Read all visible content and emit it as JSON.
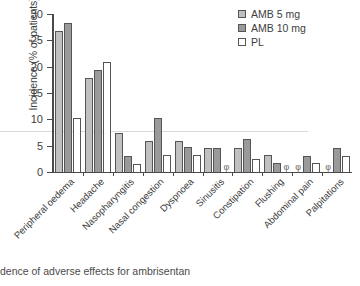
{
  "chart_data": {
    "type": "bar",
    "title": "",
    "xlabel": "",
    "ylabel": "Incidence (% of patients)",
    "ylim": [
      0,
      30
    ],
    "yticks": [
      0,
      5,
      10,
      15,
      20,
      25,
      30
    ],
    "grid": false,
    "legend_position": "top-right",
    "zero_marker": "φ",
    "zero_marker_note": "phi symbol denotes zero incidence",
    "categories": [
      "Peripheral oedema",
      "Headache",
      "Nasopharyngitis",
      "Nasal congestion",
      "Dyspnoea",
      "Sinusitis",
      "Constipation",
      "Flushing",
      "Abdominal pain",
      "Palpitations"
    ],
    "series": [
      {
        "name": "AMB 5 mg",
        "color": "#c0c0c0",
        "values": [
          26.8,
          17.8,
          7.5,
          5.8,
          5.8,
          4.5,
          4.5,
          3.2,
          0,
          0
        ]
      },
      {
        "name": "AMB 10 mg",
        "color": "#9a9a9a",
        "values": [
          28.3,
          19.3,
          3.1,
          10.3,
          4.8,
          4.5,
          6.3,
          1.8,
          3.1,
          4.5
        ]
      },
      {
        "name": "PL",
        "color": "#ffffff",
        "values": [
          10.3,
          20.8,
          1.6,
          3.2,
          3.2,
          0,
          2.5,
          0,
          1.8,
          3.1
        ]
      }
    ]
  },
  "caption": "dence of adverse effects for ambrisentan"
}
